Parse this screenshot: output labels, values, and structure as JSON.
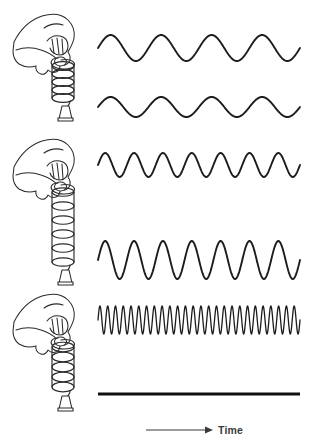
{
  "figure": {
    "background_color": "#ffffff",
    "ink_color": "#1c1c1c",
    "width": 310,
    "height": 448
  },
  "axis": {
    "label": "Time",
    "label_color": "#3a3a3a",
    "arrow_direction": "right",
    "arrow_x_start": 146,
    "arrow_x_end": 212,
    "arrow_y": 430
  },
  "illustrations": [
    {
      "name": "hand-spring-short",
      "caption": "Hand holding a short, tightly coiled spring with a hanging weight",
      "coil_turns": 6,
      "spring_length": "short",
      "weight": "bell"
    },
    {
      "name": "hand-spring-medium",
      "caption": "Hand holding a moderately stretched spring with a hanging weight",
      "coil_turns": 7,
      "spring_length": "medium",
      "weight": "bell"
    },
    {
      "name": "hand-spring-long",
      "caption": "Hand holding a long stretched spring with a hanging weight",
      "coil_turns": 7,
      "spring_length": "long",
      "weight": "bell"
    }
  ],
  "chart_data": {
    "type": "line",
    "xlabel": "Time",
    "ylabel": "",
    "grid": false,
    "legend": "none",
    "x_range": [
      0,
      1
    ],
    "series": [
      {
        "name": "wave-1",
        "waveform": "sine",
        "cycles": 4,
        "amplitude": 13,
        "baseline_y": 48,
        "x_start": 98,
        "x_end": 300,
        "stroke_width": 1.9,
        "description": "Low frequency, large amplitude"
      },
      {
        "name": "wave-2",
        "waveform": "sine",
        "cycles": 4,
        "amplitude": 10,
        "baseline_y": 107,
        "x_start": 98,
        "x_end": 300,
        "stroke_width": 1.9,
        "description": "Low frequency, medium amplitude"
      },
      {
        "name": "wave-3",
        "waveform": "sine",
        "cycles": 7,
        "amplitude": 12,
        "baseline_y": 165,
        "x_start": 98,
        "x_end": 300,
        "stroke_width": 1.9,
        "description": "Medium frequency, medium amplitude"
      },
      {
        "name": "wave-4",
        "waveform": "sine",
        "cycles": 7,
        "amplitude": 19,
        "baseline_y": 260,
        "x_start": 98,
        "x_end": 300,
        "stroke_width": 1.9,
        "description": "Medium frequency, large amplitude"
      },
      {
        "name": "wave-5",
        "waveform": "sine",
        "cycles": 26,
        "amplitude": 14,
        "baseline_y": 320,
        "x_start": 98,
        "x_end": 300,
        "stroke_width": 1.3,
        "description": "High frequency, medium amplitude"
      },
      {
        "name": "wave-6-flat",
        "waveform": "flat",
        "cycles": 0,
        "amplitude": 0,
        "baseline_y": 394,
        "x_start": 98,
        "x_end": 300,
        "stroke_width": 3,
        "description": "No oscillation, straight horizontal line"
      }
    ]
  }
}
